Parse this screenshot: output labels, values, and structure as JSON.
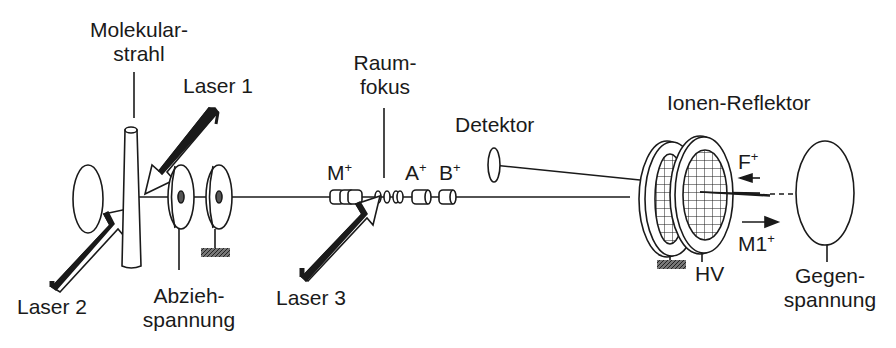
{
  "diagram": {
    "colors": {
      "ink": "#1a1a1a",
      "background": "#ffffff",
      "ground_hatch": "#555555"
    },
    "labels": {
      "molekularstrahl_1": "Molekular-",
      "molekularstrahl_2": "strahl",
      "laser1": "Laser 1",
      "laser2": "Laser 2",
      "laser3": "Laser 3",
      "abzieh_1": "Abzieh-",
      "abzieh_2": "spannung",
      "raumfokus_1": "Raum-",
      "raumfokus_2": "fokus",
      "detektor": "Detektor",
      "reflektor": "Ionen-Reflektor",
      "ion_m": "M",
      "ion_a": "A",
      "ion_b": "B",
      "ion_f": "F",
      "ion_m1": "M1",
      "charge": "+",
      "hv": "HV",
      "gegen_1": "Gegen-",
      "gegen_2": "spannung"
    },
    "components": [
      "molecular-beam-nozzle",
      "laser-1-arrow",
      "laser-2-arrow",
      "laser-3-arrow",
      "extraction-electrode",
      "grounded-electrode",
      "space-focus",
      "ion-packets",
      "detector",
      "ion-reflector-grids",
      "counter-voltage-electrode"
    ]
  }
}
